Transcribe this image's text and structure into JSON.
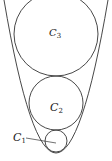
{
  "diagram": {
    "stroke_color": "#333333",
    "parabola": {
      "vertex": [
        56,
        153
      ],
      "through": [
        [
          4,
          0
        ],
        [
          108,
          0
        ]
      ]
    },
    "circles": [
      {
        "name": "C1",
        "label": "C",
        "subscript": "1",
        "cx": 56,
        "cy": 141,
        "r": 11
      },
      {
        "name": "C2",
        "label": "C",
        "subscript": "2",
        "cx": 56,
        "cy": 103,
        "r": 27
      },
      {
        "name": "C3",
        "label": "C",
        "subscript": "3",
        "cx": 56,
        "cy": 34,
        "r": 42
      }
    ],
    "labels": {
      "c1": {
        "main": "C",
        "sub": "1"
      },
      "c2": {
        "main": "C",
        "sub": "2"
      },
      "c3": {
        "main": "C",
        "sub": "3"
      }
    }
  }
}
